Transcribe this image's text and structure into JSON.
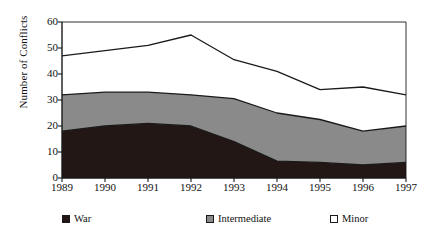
{
  "chart_data": {
    "type": "area",
    "stacked": true,
    "title": "",
    "xlabel": "",
    "ylabel": "Number of Conflicts",
    "categories": [
      "1989",
      "1990",
      "1991",
      "1992",
      "1993",
      "1994",
      "1995",
      "1996",
      "1997"
    ],
    "x": [
      1989,
      1990,
      1991,
      1992,
      1993,
      1994,
      1995,
      1996,
      1997
    ],
    "ylim": [
      0,
      60
    ],
    "xlim": [
      1989,
      1997
    ],
    "yticks": [
      0,
      10,
      20,
      30,
      40,
      50,
      60
    ],
    "ytick_labels": [
      "0",
      "10",
      "20",
      "30",
      "40",
      "50",
      "60"
    ],
    "grid": false,
    "legend_position": "bottom",
    "series": [
      {
        "name": "War",
        "color": "#231715",
        "values": [
          18,
          20,
          21,
          20,
          14,
          6.5,
          6,
          5,
          6
        ],
        "cumulative": [
          18,
          20,
          21,
          20,
          14,
          6.5,
          6,
          5,
          6
        ]
      },
      {
        "name": "Intermediate",
        "color": "#8a8a8a",
        "values": [
          14,
          13,
          12,
          12,
          16.5,
          18.5,
          16.5,
          13,
          14
        ],
        "cumulative": [
          32,
          33,
          33,
          32,
          30.5,
          25,
          22.5,
          18,
          20
        ]
      },
      {
        "name": "Minor",
        "color": "#ffffff",
        "values": [
          15,
          16,
          18,
          23,
          15,
          16,
          11.5,
          17,
          12
        ],
        "cumulative": [
          47,
          49,
          51,
          55,
          45.5,
          41,
          34,
          35,
          32
        ]
      }
    ]
  },
  "legend": {
    "items": [
      {
        "label": "War",
        "swatch": "war-swatch"
      },
      {
        "label": "Intermediate",
        "swatch": "intermediate-swatch"
      },
      {
        "label": "Minor",
        "swatch": "minor-swatch"
      }
    ]
  },
  "axes": {
    "y_axis_title": "Number of Conflicts"
  },
  "colors": {
    "war": "#231715",
    "intermediate": "#8a8a8a",
    "minor": "#ffffff",
    "axis": "#1a1a1a",
    "background": "#ffffff"
  }
}
